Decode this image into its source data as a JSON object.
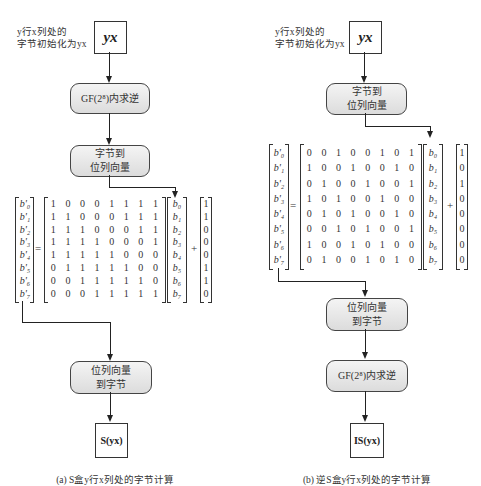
{
  "left": {
    "note": [
      "y行x列处的",
      "字节初始化为yx"
    ],
    "input_box": "yx",
    "step1": "GF(2⁸)内求逆",
    "step2": [
      "字节到",
      "位列向量"
    ],
    "output_vector": [
      "b'₀",
      "b'₁",
      "b'₂",
      "b'₃",
      "b'₄",
      "b'₅",
      "b'₆",
      "b'₇"
    ],
    "equals": "=",
    "matrix": [
      [
        1,
        0,
        0,
        0,
        1,
        1,
        1,
        1
      ],
      [
        1,
        1,
        0,
        0,
        0,
        1,
        1,
        1
      ],
      [
        1,
        1,
        1,
        0,
        0,
        0,
        1,
        1
      ],
      [
        1,
        1,
        1,
        1,
        0,
        0,
        0,
        1
      ],
      [
        1,
        1,
        1,
        1,
        1,
        0,
        0,
        0
      ],
      [
        0,
        1,
        1,
        1,
        1,
        1,
        0,
        0
      ],
      [
        0,
        0,
        1,
        1,
        1,
        1,
        1,
        0
      ],
      [
        0,
        0,
        0,
        1,
        1,
        1,
        1,
        1
      ]
    ],
    "input_vector": [
      "b₀",
      "b₁",
      "b₂",
      "b₃",
      "b₄",
      "b₅",
      "b₆",
      "b₇"
    ],
    "plus": "+",
    "constant": [
      1,
      1,
      0,
      0,
      0,
      1,
      1,
      0
    ],
    "step3": [
      "位列向量",
      "到字节"
    ],
    "output_box": "S(yx)",
    "caption": "(a) S盒y行x列处的字节计算"
  },
  "right": {
    "note": [
      "y行x列处的",
      "字节初始化为yx"
    ],
    "input_box": "yx",
    "step1": [
      "字节到",
      "位列向量"
    ],
    "output_vector": [
      "b'₀",
      "b'₁",
      "b'₂",
      "b'₃",
      "b'₄",
      "b'₅",
      "b'₆",
      "b'₇"
    ],
    "equals": "=",
    "matrix": [
      [
        0,
        0,
        1,
        0,
        0,
        1,
        0,
        1
      ],
      [
        1,
        0,
        0,
        1,
        0,
        0,
        1,
        0
      ],
      [
        0,
        1,
        0,
        0,
        1,
        0,
        0,
        1
      ],
      [
        1,
        0,
        1,
        0,
        0,
        1,
        0,
        0
      ],
      [
        0,
        1,
        0,
        1,
        0,
        0,
        1,
        0
      ],
      [
        0,
        0,
        1,
        0,
        1,
        0,
        0,
        1
      ],
      [
        1,
        0,
        0,
        1,
        0,
        1,
        0,
        0
      ],
      [
        0,
        1,
        0,
        0,
        1,
        0,
        1,
        0
      ]
    ],
    "input_vector": [
      "b₀",
      "b₁",
      "b₂",
      "b₃",
      "b₄",
      "b₅",
      "b₆",
      "b₇"
    ],
    "plus": "+",
    "constant": [
      1,
      0,
      1,
      0,
      0,
      0,
      0,
      0
    ],
    "step2": [
      "位列向量",
      "到字节"
    ],
    "step3": "GF(2⁸)内求逆",
    "output_box": "IS(yx)",
    "caption": "(b) 逆S盒y行x列处的字节计算"
  }
}
